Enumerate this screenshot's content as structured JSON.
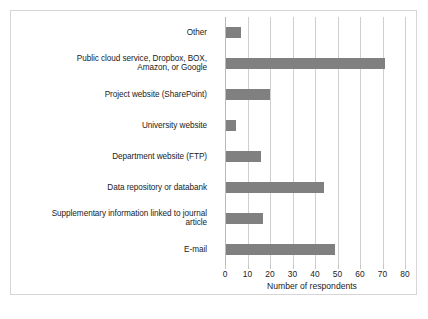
{
  "figure": {
    "frame_color": "#d6d6d6",
    "background": "#ffffff"
  },
  "chart_data": {
    "type": "bar",
    "orientation": "horizontal",
    "title": "",
    "subtitle": "",
    "xlabel": "Number of respondents",
    "ylabel": "",
    "xlim": [
      0,
      80
    ],
    "ylim": null,
    "xticks": [
      0,
      10,
      20,
      30,
      40,
      50,
      60,
      70,
      80
    ],
    "xtick_labels": [
      "0",
      "10",
      "20",
      "30",
      "40",
      "50",
      "60",
      "70",
      "80"
    ],
    "grid": "vertical",
    "legend": null,
    "bar_color": "#808080",
    "categories": [
      "Other",
      "Public cloud service, Dropbox, BOX,\nAmazon, or Google",
      "Project website (SharePoint)",
      "University website",
      "Department website (FTP)",
      "Data repository or databank",
      "Supplementary information linked to journal\narticle",
      "E-mail"
    ],
    "values": [
      7,
      71,
      20,
      5,
      16,
      44,
      17,
      49
    ],
    "annotations": []
  }
}
